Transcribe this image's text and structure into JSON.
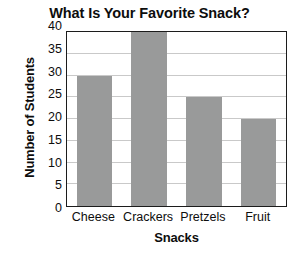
{
  "chart_data": {
    "type": "bar",
    "title": "What Is Your Favorite Snack?",
    "xlabel": "Snacks",
    "ylabel": "Number of Students",
    "categories": [
      "Cheese",
      "Crackers",
      "Pretzels",
      "Fruit"
    ],
    "values": [
      30,
      40,
      25,
      20
    ],
    "ylim": [
      0,
      40
    ],
    "ytick_labels": [
      "0",
      "5",
      "10",
      "15",
      "20",
      "25",
      "30",
      "35",
      "40"
    ],
    "ytick_values": [
      0,
      5,
      10,
      15,
      20,
      25,
      30,
      35,
      40
    ],
    "grid": true,
    "legend": "none",
    "bar_color": "#999a9a",
    "frame_color": "#1c1c1c",
    "gridline_color": "#c9c9c9",
    "background_color": "#ffffff",
    "text_color": "#0d0d0d"
  }
}
